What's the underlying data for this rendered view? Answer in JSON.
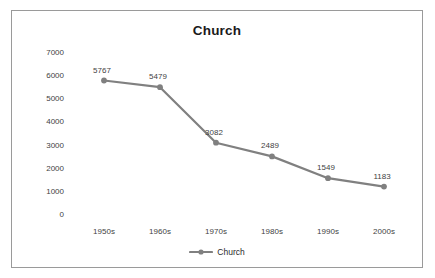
{
  "chart_data": {
    "type": "line",
    "title": "Church",
    "xlabel": "",
    "ylabel": "",
    "categories": [
      "1950s",
      "1960s",
      "1970s",
      "1980s",
      "1990s",
      "2000s"
    ],
    "series": [
      {
        "name": "Church",
        "values": [
          5767,
          5479,
          3082,
          2489,
          1549,
          1183
        ],
        "color": "#808080",
        "marker": "circle"
      }
    ],
    "point_labels": [
      "5767",
      "5479",
      "3082",
      "2489",
      "1549",
      "1183"
    ],
    "ylim": [
      0,
      7000
    ],
    "y_ticks": [
      0,
      1000,
      2000,
      3000,
      4000,
      5000,
      6000,
      7000
    ],
    "y_tick_labels": [
      "0",
      "1000",
      "2000",
      "3000",
      "4000",
      "5000",
      "6000",
      "7000"
    ],
    "grid": false,
    "legend_position": "bottom",
    "legend": [
      "Church"
    ]
  },
  "frame": {
    "border_color": "#9a9a9a",
    "background": "#ffffff"
  }
}
